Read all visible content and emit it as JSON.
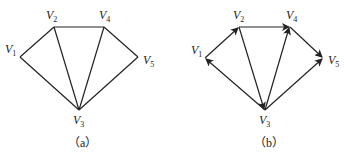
{
  "diagrams": [
    {
      "caption": "（a）",
      "type": "undirected",
      "nodes": [
        {
          "id": "V1",
          "name": "V",
          "sub": "1"
        },
        {
          "id": "V2",
          "name": "V",
          "sub": "2"
        },
        {
          "id": "V3",
          "name": "V",
          "sub": "3"
        },
        {
          "id": "V4",
          "name": "V",
          "sub": "4"
        },
        {
          "id": "V5",
          "name": "V",
          "sub": "5"
        }
      ],
      "edges": [
        [
          "V1",
          "V2"
        ],
        [
          "V2",
          "V4"
        ],
        [
          "V4",
          "V5"
        ],
        [
          "V1",
          "V3"
        ],
        [
          "V2",
          "V3"
        ],
        [
          "V3",
          "V4"
        ],
        [
          "V3",
          "V5"
        ]
      ]
    },
    {
      "caption": "（b）",
      "type": "directed",
      "nodes": [
        {
          "id": "V1",
          "name": "V",
          "sub": "1"
        },
        {
          "id": "V2",
          "name": "V",
          "sub": "2"
        },
        {
          "id": "V3",
          "name": "V",
          "sub": "3"
        },
        {
          "id": "V4",
          "name": "V",
          "sub": "4"
        },
        {
          "id": "V5",
          "name": "V",
          "sub": "5"
        }
      ],
      "edges": [
        [
          "V1",
          "V2"
        ],
        [
          "V2",
          "V4"
        ],
        [
          "V4",
          "V5"
        ],
        [
          "V3",
          "V1"
        ],
        [
          "V2",
          "V3"
        ],
        [
          "V3",
          "V4"
        ],
        [
          "V3",
          "V5"
        ]
      ]
    }
  ]
}
